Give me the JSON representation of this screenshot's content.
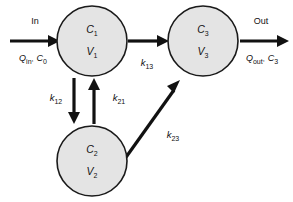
{
  "figure": {
    "type": "compartment-diagram",
    "background_color": "#ffffff",
    "node_fill_color": "#e4e4e4",
    "node_stroke_color": "#1a1a1a",
    "arrow_color": "#111111"
  },
  "compartments": [
    {
      "id": "c1",
      "concentration": "C",
      "concentration_sub": "1",
      "volume": "V",
      "volume_sub": "1"
    },
    {
      "id": "c2",
      "concentration": "C",
      "concentration_sub": "2",
      "volume": "V",
      "volume_sub": "2"
    },
    {
      "id": "c3",
      "concentration": "C",
      "concentration_sub": "3",
      "volume": "V",
      "volume_sub": "3"
    }
  ],
  "inlet": {
    "title": "In",
    "flow_symbol": "Q",
    "flow_sub": "in",
    "conc_symbol": "C",
    "conc_sub": "0",
    "separator": ","
  },
  "outlet": {
    "title": "Out",
    "flow_symbol": "Q",
    "flow_sub": "out",
    "conc_symbol": "C",
    "conc_sub": "3",
    "separator": ","
  },
  "rate_constants": [
    {
      "id": "k12",
      "symbol": "k",
      "sub": "12"
    },
    {
      "id": "k21",
      "symbol": "k",
      "sub": "21"
    },
    {
      "id": "k13",
      "symbol": "k",
      "sub": "13"
    },
    {
      "id": "k23",
      "symbol": "k",
      "sub": "23"
    }
  ]
}
